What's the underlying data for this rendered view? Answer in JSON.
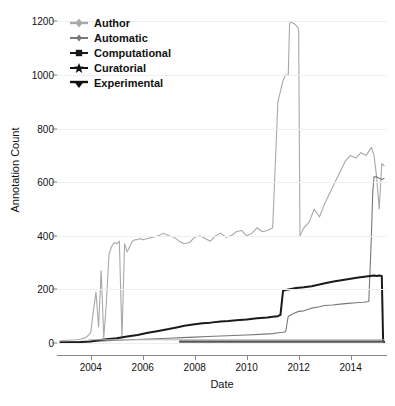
{
  "chart_data": {
    "type": "line",
    "title": "",
    "xlabel": "Date",
    "ylabel": "Annotation Count",
    "xlim": [
      2002.7,
      2015.4
    ],
    "ylim": [
      0,
      1250
    ],
    "grid": true,
    "legend_position": "top-left",
    "xticks": [
      2004,
      2006,
      2008,
      2010,
      2012,
      2014
    ],
    "xticklabels": [
      "2004",
      "2006",
      "2008",
      "2010",
      "2012",
      "2014"
    ],
    "yticks": [
      0,
      200,
      400,
      600,
      800,
      1000,
      1200
    ],
    "yticklabels": [
      "0",
      "200",
      "400",
      "600",
      "800",
      "1000",
      "1200"
    ],
    "series": [
      {
        "name": "Author",
        "color": "#a8a8a8",
        "marker": "plus-diamond",
        "x": [
          2002.8,
          2003.1,
          2003.4,
          2003.6,
          2003.8,
          2003.9,
          2004.0,
          2004.1,
          2004.2,
          2004.3,
          2004.4,
          2004.5,
          2004.6,
          2004.7,
          2004.8,
          2004.9,
          2005.0,
          2005.1,
          2005.2,
          2005.3,
          2005.4,
          2005.5,
          2005.6,
          2005.7,
          2005.8,
          2005.9,
          2006.0,
          2006.2,
          2006.4,
          2006.6,
          2006.8,
          2007.0,
          2007.2,
          2007.4,
          2007.6,
          2007.8,
          2008.0,
          2008.2,
          2008.4,
          2008.6,
          2008.8,
          2009.0,
          2009.2,
          2009.4,
          2009.6,
          2009.8,
          2010.0,
          2010.2,
          2010.4,
          2010.6,
          2010.8,
          2011.0,
          2011.2,
          2011.4,
          2011.5,
          2011.6,
          2011.65,
          2011.7,
          2011.75,
          2011.85,
          2011.95,
          2012.0,
          2012.05,
          2012.1,
          2012.2,
          2012.4,
          2012.6,
          2012.8,
          2013.0,
          2013.2,
          2013.4,
          2013.6,
          2013.8,
          2014.0,
          2014.2,
          2014.4,
          2014.6,
          2014.8,
          2014.9,
          2015.0,
          2015.1,
          2015.2,
          2015.3
        ],
        "y": [
          8,
          10,
          12,
          14,
          20,
          28,
          40,
          120,
          190,
          60,
          270,
          20,
          150,
          330,
          360,
          375,
          370,
          380,
          20,
          370,
          340,
          360,
          380,
          385,
          385,
          390,
          385,
          390,
          395,
          400,
          410,
          400,
          395,
          380,
          370,
          375,
          395,
          400,
          390,
          380,
          400,
          410,
          395,
          400,
          415,
          420,
          400,
          410,
          430,
          415,
          420,
          430,
          900,
          980,
          1000,
          1000,
          1190,
          1200,
          1195,
          1190,
          1180,
          1170,
          400,
          410,
          430,
          450,
          500,
          470,
          520,
          560,
          600,
          640,
          680,
          700,
          690,
          710,
          700,
          730,
          700,
          620,
          500,
          670,
          660
        ]
      },
      {
        "name": "Automatic",
        "color": "#787878",
        "marker": "plus-diamond-small",
        "x": [
          2002.8,
          2003.5,
          2004.0,
          2004.5,
          2005.0,
          2005.5,
          2006.0,
          2006.5,
          2007.0,
          2007.5,
          2008.0,
          2008.5,
          2009.0,
          2009.5,
          2010.0,
          2010.5,
          2011.0,
          2011.2,
          2011.4,
          2011.5,
          2011.6,
          2011.8,
          2012.0,
          2012.2,
          2012.5,
          2012.8,
          2013.0,
          2013.3,
          2013.6,
          2013.9,
          2014.2,
          2014.5,
          2014.7,
          2014.8,
          2014.85,
          2014.9,
          2015.0,
          2015.1,
          2015.2,
          2015.3
        ],
        "y": [
          2,
          4,
          6,
          8,
          10,
          12,
          14,
          16,
          18,
          20,
          22,
          24,
          26,
          28,
          30,
          32,
          35,
          38,
          40,
          42,
          100,
          110,
          118,
          120,
          130,
          135,
          140,
          142,
          145,
          148,
          150,
          152,
          155,
          400,
          560,
          620,
          620,
          615,
          610,
          615
        ]
      },
      {
        "name": "Computational",
        "color": "#1a1a1a",
        "marker": "square",
        "x": [
          2002.8,
          2003.2,
          2003.6,
          2004.0,
          2004.3,
          2004.6,
          2005.0,
          2005.4,
          2005.8,
          2006.2,
          2006.6,
          2007.0,
          2007.3,
          2007.6,
          2008.0,
          2008.3,
          2008.6,
          2009.0,
          2009.3,
          2009.6,
          2010.0,
          2010.4,
          2010.8,
          2011.0,
          2011.2,
          2011.3,
          2011.4,
          2011.6,
          2011.9,
          2012.2,
          2012.5,
          2012.8,
          2013.1,
          2013.4,
          2013.7,
          2014.0,
          2014.3,
          2014.6,
          2014.9,
          2015.0,
          2015.1,
          2015.2,
          2015.25,
          2015.3
        ],
        "y": [
          2,
          3,
          4,
          6,
          10,
          14,
          18,
          24,
          30,
          38,
          45,
          52,
          58,
          64,
          70,
          74,
          76,
          80,
          82,
          85,
          88,
          92,
          95,
          98,
          100,
          105,
          195,
          200,
          205,
          208,
          212,
          218,
          225,
          230,
          235,
          240,
          244,
          248,
          252,
          250,
          252,
          250,
          10,
          0
        ]
      },
      {
        "name": "Curatorial",
        "color": "#b4b4b4",
        "marker": "star",
        "x": [
          2003.9,
          2004.5,
          2006.0,
          2008.0,
          2010.0,
          2012.0,
          2014.0,
          2015.3
        ],
        "y": [
          12,
          12,
          12,
          12,
          12,
          12,
          12,
          12
        ]
      },
      {
        "name": "Experimental",
        "color": "#555555",
        "marker": "triangle-down",
        "x": [
          2007.4,
          2008.0,
          2010.0,
          2012.0,
          2014.0,
          2015.3
        ],
        "y": [
          5,
          5,
          5,
          5,
          5,
          5
        ]
      }
    ]
  },
  "axes": {
    "ylabel": "Annotation Count",
    "xlabel": "Date"
  },
  "legend": {
    "items": [
      {
        "label": "Author"
      },
      {
        "label": "Automatic"
      },
      {
        "label": "Computational"
      },
      {
        "label": "Curatorial"
      },
      {
        "label": "Experimental"
      }
    ]
  }
}
